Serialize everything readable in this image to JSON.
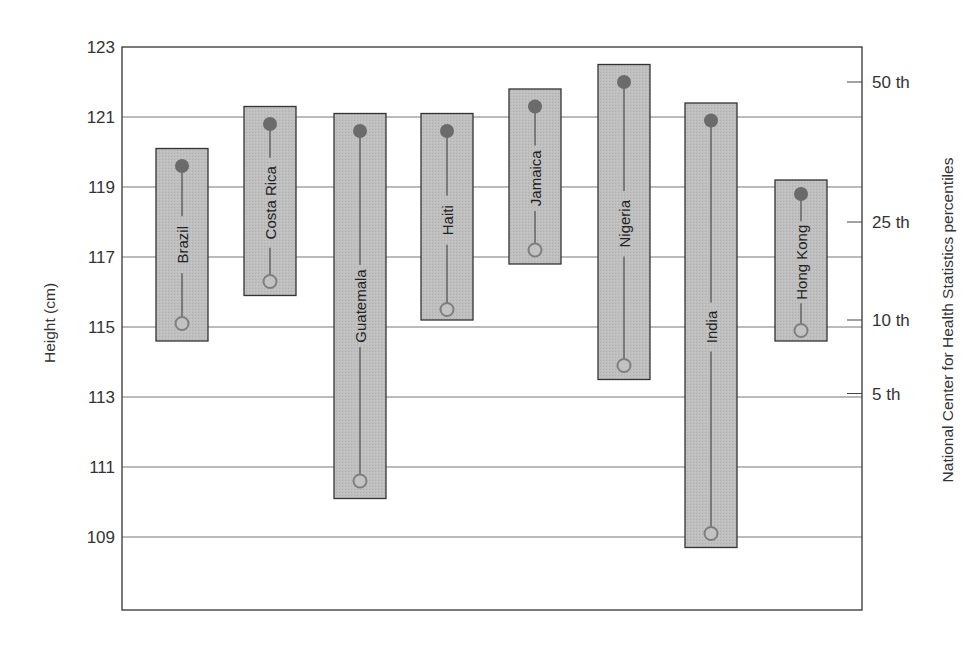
{
  "chart_data": {
    "type": "range-box",
    "title": "",
    "ylabel": "Height (cm)",
    "ylabel_right": "National Center for Health Statistics percentiles",
    "xlabel": "",
    "ylim": [
      107,
      123
    ],
    "yticks": [
      109,
      111,
      113,
      115,
      117,
      119,
      121,
      123
    ],
    "grid": true,
    "right_axis_ticks": [
      {
        "label": "50 th",
        "value": 122.0
      },
      {
        "label": "25 th",
        "value": 118.0
      },
      {
        "label": "10 th",
        "value": 115.2
      },
      {
        "label": "5 th",
        "value": 113.1
      }
    ],
    "categories": [
      "Brazil",
      "Costa Rica",
      "Guatemala",
      "Haiti",
      "Jamaica",
      "Nigeria",
      "India",
      "Hong Kong"
    ],
    "series": [
      {
        "name": "upper (filled circle)",
        "values": [
          119.6,
          120.8,
          120.6,
          120.6,
          121.3,
          122.0,
          120.9,
          118.8
        ]
      },
      {
        "name": "lower (open circle)",
        "values": [
          115.1,
          116.3,
          110.6,
          115.5,
          117.2,
          113.9,
          109.1,
          114.9
        ]
      },
      {
        "name": "box top",
        "values": [
          120.1,
          121.3,
          121.1,
          121.1,
          121.8,
          122.5,
          121.4,
          119.2
        ]
      },
      {
        "name": "box bottom",
        "values": [
          114.6,
          115.9,
          110.1,
          115.2,
          116.8,
          113.5,
          108.7,
          114.6
        ]
      }
    ]
  },
  "layout": {
    "plot": {
      "left": 122,
      "top": 47,
      "right": 862,
      "bottom": 610
    },
    "y_top_value": 123,
    "px_per_unit": 35,
    "box_width": 52,
    "box_centers": [
      182,
      270,
      360,
      447,
      535,
      624,
      711,
      801
    ]
  },
  "colors": {
    "box_fill": "#bcbcbc",
    "box_stroke": "#333333",
    "stem": "#7a7a7a",
    "filled_marker": "#6b6b6b",
    "open_marker": "#7f7f7f",
    "grid": "#777777",
    "frame": "#333333"
  }
}
